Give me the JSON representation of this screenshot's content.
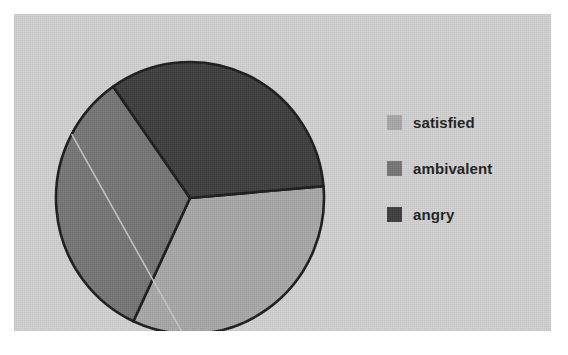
{
  "chart_data": {
    "type": "pie",
    "title": "",
    "categories": [
      "satisfied",
      "ambivalent",
      "angry"
    ],
    "values": [
      33.3,
      33.3,
      33.4
    ],
    "value_unit": "percent",
    "legend_position": "right",
    "grid": false,
    "slices": [
      {
        "label": "satisfied",
        "value": 33.3,
        "color": "#a8a8a8",
        "start_angle_deg": -5,
        "end_angle_deg": 115
      },
      {
        "label": "ambivalent",
        "value": 33.3,
        "color": "#757575",
        "start_angle_deg": 115,
        "end_angle_deg": 235
      },
      {
        "label": "angry",
        "value": 33.4,
        "color": "#3c3c3c",
        "start_angle_deg": 235,
        "end_angle_deg": 355
      }
    ]
  },
  "figure": {
    "background_color": "#ffffff",
    "panel_color": "#d2d2d2",
    "outline_color": "#1a1a1a"
  },
  "pie": {
    "center_x": 162,
    "center_y": 164,
    "radius_x": 134,
    "radius_y": 136,
    "artifact_line": {
      "name": "scan-streak",
      "color": "#c9c9c9"
    }
  },
  "legend": {
    "items": [
      {
        "label": "satisfied",
        "color": "#a8a8a8"
      },
      {
        "label": "ambivalent",
        "color": "#757575"
      },
      {
        "label": "angry",
        "color": "#3c3c3c"
      }
    ]
  }
}
